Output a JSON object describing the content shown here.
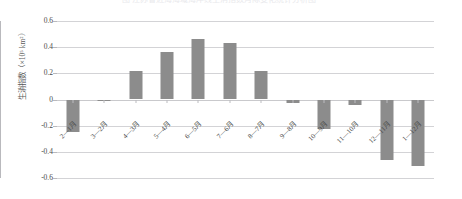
{
  "figure": {
    "cropped_title_fragment": "图 江苏省近海海域海岸线生消指数月际变化统计分析图",
    "background_color": "#ffffff",
    "bar_color": "#8c8c8c",
    "gridline_color": "#d3d3d6"
  },
  "chart_data": {
    "type": "bar",
    "title": "",
    "xlabel": "",
    "ylabel": "生消指数（×10⁵ km²）",
    "ylabel_plain": "生消指数 ( × 10^5 km^2 )",
    "ylim": [
      -0.6,
      0.6
    ],
    "ytick_labels": [
      "0.6",
      "0.4",
      "0.2",
      "0",
      "-0.2",
      "-0.4",
      "-0.6"
    ],
    "ytick_values": [
      0.6,
      0.4,
      0.2,
      0,
      -0.2,
      -0.4,
      -0.6
    ],
    "grid": true,
    "grid_axis": "y",
    "legend": false,
    "legend_position": "none",
    "orientation": "vertical",
    "categories": [
      "2—1月",
      "3—2月",
      "4—3月",
      "5—4月",
      "6—5月",
      "7—6月",
      "8—7月",
      "9—8月",
      "10—9月",
      "11—10月",
      "12—11月",
      "1—12月"
    ],
    "values": [
      -0.25,
      -0.01,
      0.215,
      0.365,
      0.465,
      0.43,
      0.215,
      -0.025,
      -0.225,
      -0.045,
      -0.465,
      -0.51
    ]
  }
}
